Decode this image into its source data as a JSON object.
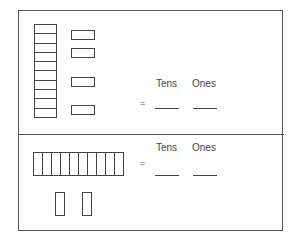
{
  "worksheet": {
    "top_panel": {
      "tens_rods": 1,
      "ones_units": 4,
      "rod_orientation": "vertical",
      "column_headers": [
        "Tens",
        "Ones"
      ],
      "equals_sign": "=",
      "answer_blanks": [
        "",
        ""
      ]
    },
    "bottom_panel": {
      "tens_rods": 1,
      "ones_units": 2,
      "rod_orientation": "horizontal",
      "column_headers": [
        "Tens",
        "Ones"
      ],
      "equals_sign": "=",
      "answer_blanks": [
        "",
        ""
      ]
    }
  }
}
